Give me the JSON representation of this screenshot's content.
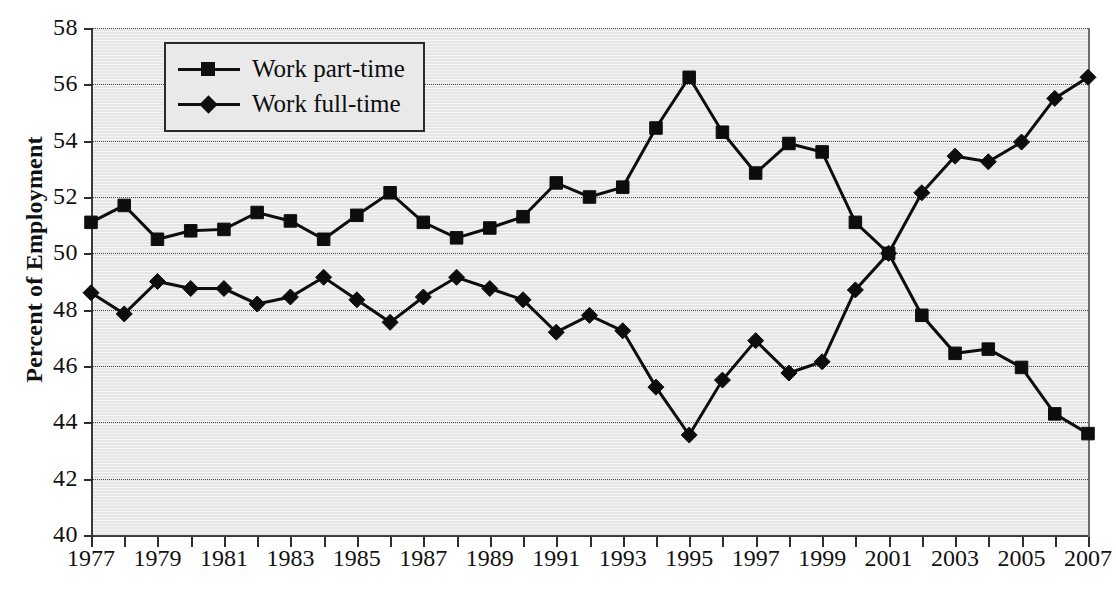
{
  "chart_data": {
    "type": "line",
    "title": "",
    "xlabel": "",
    "ylabel": "Percent of Employment",
    "ylim": [
      40,
      58
    ],
    "ytick_step": 2,
    "yticks": [
      40,
      42,
      44,
      46,
      48,
      50,
      52,
      54,
      56,
      58
    ],
    "xlim": [
      1977,
      2007
    ],
    "xticks": [
      1977,
      1978,
      1979,
      1980,
      1981,
      1982,
      1983,
      1984,
      1985,
      1986,
      1987,
      1988,
      1989,
      1990,
      1991,
      1992,
      1993,
      1994,
      1995,
      1996,
      1997,
      1998,
      1999,
      2000,
      2001,
      2002,
      2003,
      2004,
      2005,
      2006,
      2007
    ],
    "xtick_labels": [
      "1977",
      "",
      "1979",
      "",
      "1981",
      "",
      "1983",
      "",
      "1985",
      "",
      "1987",
      "",
      "1989",
      "",
      "1991",
      "",
      "1993",
      "",
      "1995",
      "",
      "1997",
      "",
      "1999",
      "",
      "2001",
      "",
      "2003",
      "",
      "2005",
      "",
      "2007"
    ],
    "x": [
      1977,
      1978,
      1979,
      1980,
      1981,
      1982,
      1983,
      1984,
      1985,
      1986,
      1987,
      1988,
      1989,
      1990,
      1991,
      1992,
      1993,
      1994,
      1995,
      1996,
      1997,
      1998,
      1999,
      2000,
      2001,
      2002,
      2003,
      2004,
      2005,
      2006,
      2007
    ],
    "grid": true,
    "grid_axis": "y",
    "grid_style": "dotted",
    "legend_position": "upper-left",
    "series": [
      {
        "name": "Work part-time",
        "marker": "square",
        "values": [
          51.1,
          51.7,
          50.5,
          50.8,
          50.85,
          51.45,
          51.15,
          50.5,
          51.35,
          52.15,
          51.1,
          50.55,
          50.9,
          51.3,
          52.5,
          52.0,
          52.35,
          54.45,
          56.25,
          54.3,
          52.85,
          53.9,
          53.6,
          51.1,
          50.0,
          47.8,
          46.45,
          46.6,
          45.95,
          44.3,
          43.6
        ]
      },
      {
        "name": "Work full-time",
        "marker": "diamond",
        "values": [
          48.6,
          47.85,
          49.0,
          48.75,
          48.75,
          48.2,
          48.45,
          49.15,
          48.35,
          47.55,
          48.45,
          49.15,
          48.75,
          48.35,
          47.2,
          47.8,
          47.25,
          45.25,
          43.55,
          45.5,
          46.9,
          45.75,
          46.15,
          48.7,
          50.0,
          52.15,
          53.45,
          53.25,
          53.95,
          55.5,
          56.25
        ]
      }
    ]
  },
  "legend": {
    "items": [
      {
        "label": "Work part-time",
        "marker": "square"
      },
      {
        "label": "Work full-time",
        "marker": "diamond"
      }
    ]
  },
  "axis": {
    "y_title": "Percent of Employment"
  }
}
